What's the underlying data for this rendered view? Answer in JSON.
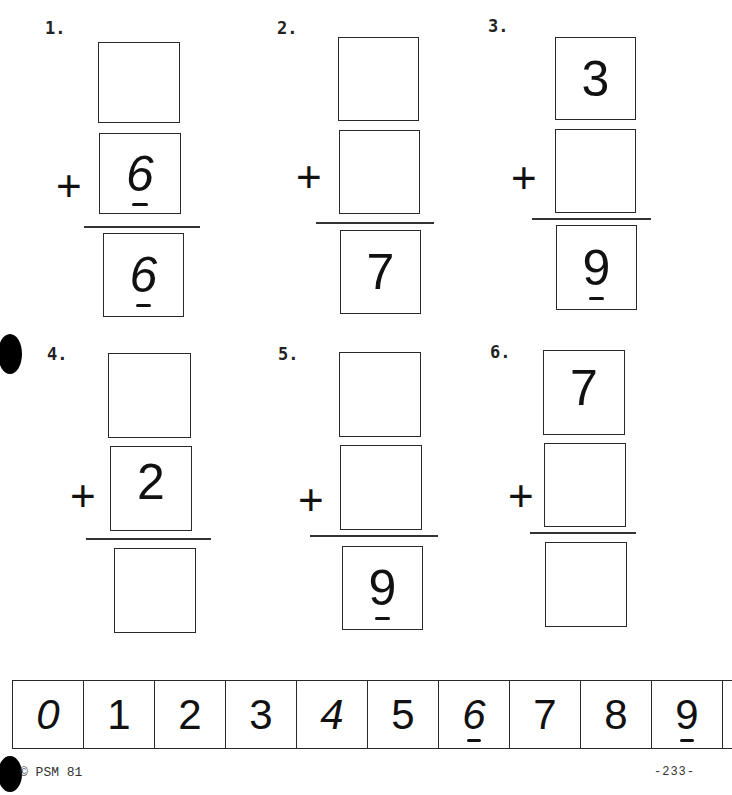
{
  "problems": [
    {
      "number": "1.",
      "operator": "+",
      "top": "",
      "middle": "6",
      "middle_underline": true,
      "result": "6",
      "result_underline": true
    },
    {
      "number": "2.",
      "operator": "+",
      "top": "",
      "middle": "",
      "result": "7"
    },
    {
      "number": "3.",
      "operator": "+",
      "top": "3",
      "middle": "",
      "result": "9",
      "result_underline": true
    },
    {
      "number": "4.",
      "operator": "+",
      "top": "",
      "middle": "2",
      "result": ""
    },
    {
      "number": "5.",
      "operator": "+",
      "top": "",
      "middle": "",
      "result": "9",
      "result_underline": true
    },
    {
      "number": "6.",
      "operator": "+",
      "top": "7",
      "middle": "",
      "result": ""
    }
  ],
  "number_strip": [
    "0",
    "1",
    "2",
    "3",
    "4",
    "5",
    "6",
    "7",
    "8",
    "9"
  ],
  "number_strip_underlined": [
    "6",
    "9"
  ],
  "footer": {
    "copyright": "© PSM 81",
    "page_number": "-233-"
  }
}
